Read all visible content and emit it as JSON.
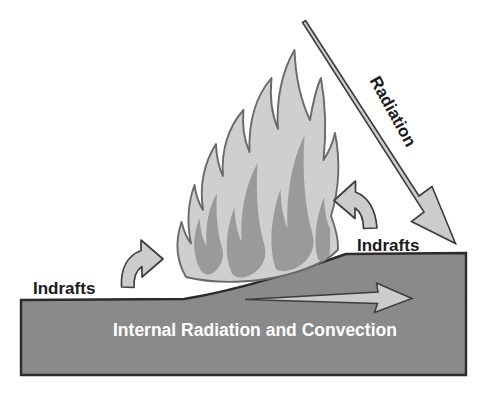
{
  "diagram": {
    "type": "schematic-illustration",
    "canvas": {
      "width": 487,
      "height": 397
    },
    "background_color": "#ffffff",
    "colors": {
      "ground_fill": "#8a8a8a",
      "ground_stroke": "#2b2b2b",
      "flame_outer_fill": "#cfcfcf",
      "flame_inner_fill": "#9a9a9a",
      "flame_stroke": "#5a5a5a",
      "arrow_fill": "#cccccc",
      "arrow_stroke": "#3d3d3d",
      "text_dark": "#1a1a1a",
      "text_light": "#ffffff"
    },
    "labels": {
      "radiation": "Radiation",
      "indrafts_left": "Indrafts",
      "indrafts_right": "Indrafts",
      "internal": "Internal Radiation and Convection"
    },
    "elements": [
      {
        "name": "ground-slope",
        "kind": "polygon",
        "fill": "#8a8a8a"
      },
      {
        "name": "flame",
        "kind": "shape",
        "fill": "#cfcfcf"
      },
      {
        "name": "radiation-arrow",
        "kind": "arrow",
        "direction": "down-right"
      },
      {
        "name": "indraft-arrow-left",
        "kind": "curved-arrow",
        "direction": "up"
      },
      {
        "name": "indraft-arrow-right",
        "kind": "curved-arrow",
        "direction": "up"
      },
      {
        "name": "internal-arrow",
        "kind": "arrow",
        "direction": "right"
      }
    ],
    "label_positions": {
      "radiation": {
        "x": 392,
        "y": 112,
        "rotation": 61
      },
      "indrafts_left": {
        "x": 33,
        "y": 290
      },
      "indrafts_right": {
        "x": 357,
        "y": 247
      },
      "internal": {
        "x": 113,
        "y": 330
      }
    }
  }
}
